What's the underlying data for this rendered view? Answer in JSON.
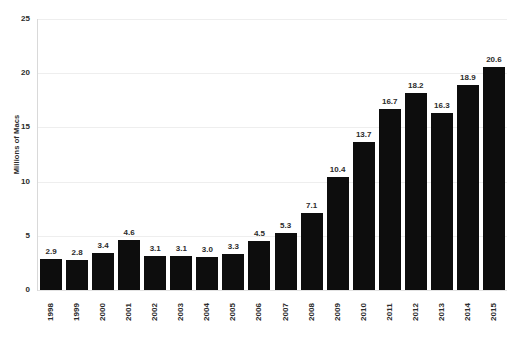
{
  "chart_data": {
    "type": "bar",
    "title": "",
    "subtitle": "",
    "xlabel": "",
    "ylabel": "Millions of Macs",
    "ylim": [
      0,
      25
    ],
    "yticks": [
      0,
      5,
      10,
      15,
      20,
      25
    ],
    "ytick_labels": [
      "0",
      "5",
      "10",
      "15",
      "20",
      "25"
    ],
    "grid": true,
    "legend": false,
    "legend_position": "none",
    "bar_color": "#0d0d0d",
    "gridline_color": "#eeeeee",
    "text_color": "#2b2b2b",
    "background_color": "#ffffff",
    "x_tick_rotation": -90,
    "categories": [
      "1998",
      "1999",
      "2000",
      "2001",
      "2002",
      "2003",
      "2004",
      "2005",
      "2006",
      "2007",
      "2008",
      "2009",
      "2010",
      "2011",
      "2012",
      "2013",
      "2014",
      "2015"
    ],
    "values": [
      2.9,
      2.8,
      3.4,
      4.6,
      3.1,
      3.1,
      3.0,
      3.3,
      4.5,
      5.3,
      7.1,
      10.4,
      13.7,
      16.7,
      18.2,
      16.3,
      18.9,
      20.6
    ],
    "value_labels": [
      "2.9",
      "2.8",
      "3.4",
      "4.6",
      "3.1",
      "3.1",
      "3.0",
      "3.3",
      "4.5",
      "5.3",
      "7.1",
      "10.4",
      "13.7",
      "16.7",
      "18.2",
      "16.3",
      "18.9",
      "20.6"
    ]
  }
}
